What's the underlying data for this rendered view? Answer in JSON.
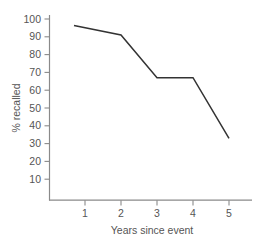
{
  "chart_data": {
    "type": "line",
    "title": "",
    "subtitle": "",
    "xlabel": "Years since event",
    "ylabel": "% recalled",
    "x": [
      1,
      2,
      3,
      4,
      5
    ],
    "xtick_labels": [
      "1",
      "2",
      "3",
      "4",
      "5"
    ],
    "ytick_labels": [
      "10",
      "20",
      "30",
      "40",
      "50",
      "60",
      "70",
      "80",
      "90",
      "100"
    ],
    "ytick_values": [
      10,
      20,
      30,
      40,
      50,
      60,
      70,
      80,
      90,
      100
    ],
    "series": [
      {
        "name": "% recalled",
        "values": [
          97,
          91,
          67,
          67,
          33
        ],
        "color": "#333333"
      }
    ],
    "xlim": [
      0.62,
      5.45
    ],
    "ylim": [
      0,
      104
    ],
    "grid": false,
    "legend": false,
    "legend_position": "none",
    "annotations": [],
    "axis_color": "#8a8a8a",
    "line_color": "#333333",
    "background": "#ffffff"
  }
}
